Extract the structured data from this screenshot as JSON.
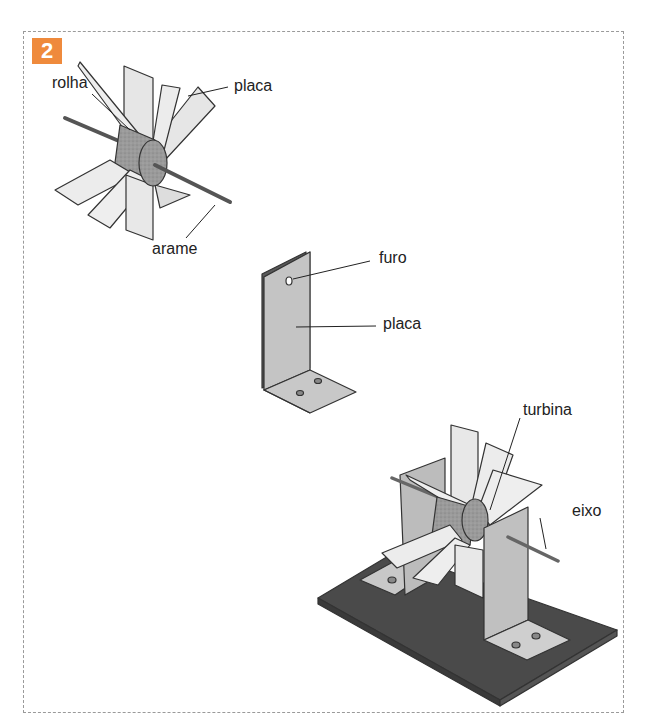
{
  "figure": {
    "number": "2",
    "badge_color": "#ef8a3c",
    "panels": [
      {
        "name": "turbine-assembly",
        "labels": {
          "cork": "rolha",
          "plate": "placa",
          "wire": "arame"
        }
      },
      {
        "name": "l-bracket",
        "labels": {
          "hole": "furo",
          "plate": "placa"
        }
      },
      {
        "name": "mounted-turbine",
        "labels": {
          "turbine": "turbina",
          "axle": "eixo"
        }
      }
    ]
  }
}
